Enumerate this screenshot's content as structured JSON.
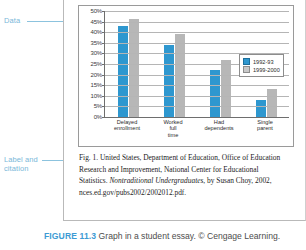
{
  "annotations": {
    "data_label": "Data",
    "label_citation_line1": "Label and",
    "label_citation_line2": "citation"
  },
  "chart_data": {
    "type": "bar",
    "title": "",
    "xlabel": "",
    "ylabel": "",
    "ylim": [
      0,
      50
    ],
    "ytick_labels": [
      "50%",
      "45%",
      "40%",
      "35%",
      "30%",
      "25%",
      "20%",
      "15%",
      "10%",
      "5%",
      "0%"
    ],
    "ytick_values": [
      50,
      45,
      40,
      35,
      30,
      25,
      20,
      15,
      10,
      5,
      0
    ],
    "grid": true,
    "legend_position": "right",
    "categories": [
      "Delayed enrollment",
      "Worked full time",
      "Had dependents",
      "Single parent"
    ],
    "category_lines": [
      [
        "Delayed",
        "enrollment"
      ],
      [
        "Worked",
        "full",
        "time"
      ],
      [
        "Had",
        "dependents"
      ],
      [
        "Single",
        "parent"
      ]
    ],
    "series": [
      {
        "name": "1992-93",
        "color": "#2e97cf",
        "values": [
          43,
          34,
          22,
          8
        ]
      },
      {
        "name": "1999-2000",
        "color": "#b7b7b7",
        "values": [
          46,
          39,
          27,
          13
        ]
      }
    ]
  },
  "citation": {
    "line1": "Fig. 1. United States, Department of Education, Office of Education",
    "line2": "Research and Improvement, National Center for Educational",
    "line3_pre": "Statistics. ",
    "line3_italic": "Nontraditional Undergraduates",
    "line3_post": ", by Susan Choy, 2002,",
    "line4": "nces.ed.gov/pubs2002/2002012.pdf."
  },
  "figure_caption": {
    "number": "FIGURE 11.3",
    "text": "Graph in a student essay. © Cengage Learning."
  }
}
